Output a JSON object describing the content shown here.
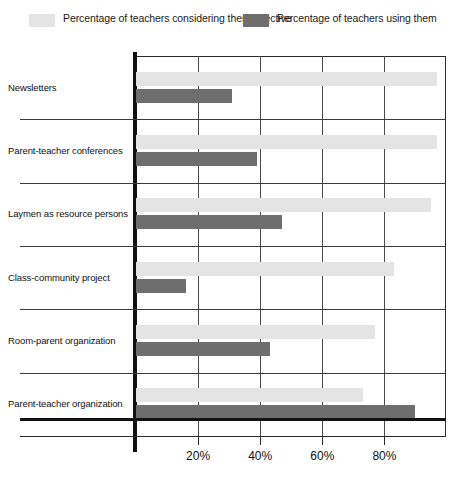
{
  "legend": {
    "items": [
      {
        "label": "Percentage of teachers considering them effective",
        "color": "#e4e4e4",
        "swatch_name": "legend-swatch-effective"
      },
      {
        "label": "Percentage of teachers using them",
        "color": "#6e6e6e",
        "swatch_name": "legend-swatch-using"
      }
    ]
  },
  "axis": {
    "tick_labels": [
      "20%",
      "40%",
      "60%",
      "80%"
    ],
    "tick_values": [
      20,
      40,
      60,
      80
    ]
  },
  "chart_data": {
    "type": "bar",
    "orientation": "horizontal",
    "title": "",
    "xlabel": "",
    "ylabel": "",
    "xlim": [
      0,
      100
    ],
    "grid": true,
    "legend_position": "top",
    "categories": [
      "Newsletters",
      "Parent-teacher conferences",
      "Laymen as resource persons",
      "Class-community project",
      "Room-parent organization",
      "Parent-teacher organization"
    ],
    "series": [
      {
        "name": "Percentage of teachers considering them effective",
        "color": "#e4e4e4",
        "values": [
          97,
          97,
          95,
          83,
          77,
          73
        ]
      },
      {
        "name": "Percentage of teachers using them",
        "color": "#6e6e6e",
        "values": [
          31,
          39,
          47,
          16,
          43,
          90
        ]
      }
    ]
  }
}
